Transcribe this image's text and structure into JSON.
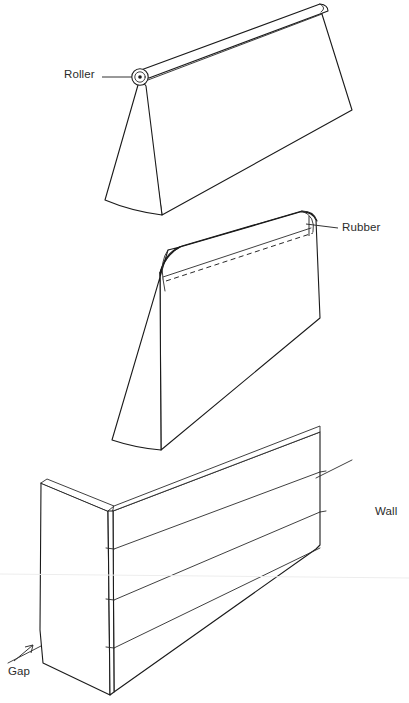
{
  "diagram": {
    "type": "line-drawing",
    "background_color": "#ffffff",
    "ink_color": "#1a1a1a",
    "labels": {
      "roller": "Roller",
      "rubber": "Rubber",
      "wall": "Wall",
      "gap": "Gap"
    },
    "parts": [
      {
        "id": "top-wedge",
        "name": "Wedge form with roller at apex",
        "callout": "Roller",
        "feature": "cylindrical roller along upper spine"
      },
      {
        "id": "middle-wedge",
        "name": "Wedge form with rubber edge",
        "callout": "Rubber",
        "feature": "rounded rubber cap with dashed seam line"
      },
      {
        "id": "bottom-wall",
        "name": "Corner wall of stacked courses",
        "callout": "Wall",
        "courses": 4,
        "feature": "gap at base of end face"
      }
    ],
    "annotations": [
      {
        "text": "Roller",
        "leader": "horizontal line to roller hub"
      },
      {
        "text": "Rubber",
        "leader": "horizontal line to rounded top corner"
      },
      {
        "text": "Wall",
        "leader": "none"
      },
      {
        "text": "Gap",
        "leader": "arrow pointing up-right to wall base"
      }
    ]
  }
}
